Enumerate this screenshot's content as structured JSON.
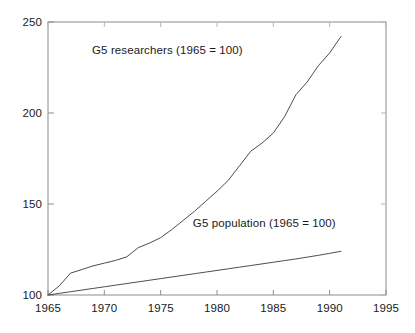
{
  "chart_data": {
    "type": "line",
    "title": "",
    "subtitle": "",
    "xlabel": "",
    "ylabel": "",
    "xlim": [
      1965,
      1995
    ],
    "ylim": [
      100,
      250
    ],
    "grid": false,
    "legend_position": "inline-annotation",
    "x_ticks": [
      1965,
      1970,
      1975,
      1980,
      1985,
      1990,
      1995
    ],
    "x_tick_labels": [
      "1965",
      "1970",
      "1975",
      "1980",
      "1985",
      "1990",
      "1995"
    ],
    "y_ticks": [
      100,
      150,
      200,
      250
    ],
    "y_tick_labels": [
      "100",
      "150",
      "200",
      "250"
    ],
    "annotations": [
      {
        "id": "researchers-annotation",
        "text": "G5 researchers (1965 = 100)",
        "x": 1975.6,
        "y": 234
      },
      {
        "id": "population-annotation",
        "text": "G5 population (1965 = 100)",
        "x": 1984.2,
        "y": 139
      }
    ],
    "series": [
      {
        "name": "G5 researchers (1965 = 100)",
        "color": "#4d4d4d",
        "x": [
          1965,
          1966,
          1967,
          1968,
          1969,
          1970,
          1971,
          1972,
          1973,
          1974,
          1975,
          1976,
          1977,
          1978,
          1979,
          1980,
          1981,
          1982,
          1983,
          1984,
          1985,
          1986,
          1987,
          1988,
          1989,
          1990,
          1991
        ],
        "values": [
          100,
          105,
          112,
          114,
          116,
          117.5,
          119,
          121,
          126,
          128.5,
          131.5,
          136,
          141,
          146,
          151.5,
          157,
          163,
          171,
          179,
          183.5,
          189,
          198,
          210,
          217,
          226,
          233,
          242
        ]
      },
      {
        "name": "G5 population (1965 = 100)",
        "color": "#4d4d4d",
        "x": [
          1965,
          1966,
          1967,
          1968,
          1969,
          1970,
          1971,
          1972,
          1973,
          1974,
          1975,
          1976,
          1977,
          1978,
          1979,
          1980,
          1981,
          1982,
          1983,
          1984,
          1985,
          1986,
          1987,
          1988,
          1989,
          1990,
          1991
        ],
        "values": [
          100,
          100.9,
          101.8,
          102.7,
          103.6,
          104.5,
          105.4,
          106.3,
          107.2,
          108.1,
          109.0,
          109.9,
          110.8,
          111.7,
          112.6,
          113.5,
          114.4,
          115.3,
          116.2,
          117.1,
          118.0,
          118.9,
          119.8,
          120.8,
          121.8,
          122.9,
          124.0
        ]
      }
    ]
  },
  "axes": {
    "frame_color": "#8c8c8c",
    "line_color": "#4d4d4d",
    "background": "#ffffff"
  }
}
